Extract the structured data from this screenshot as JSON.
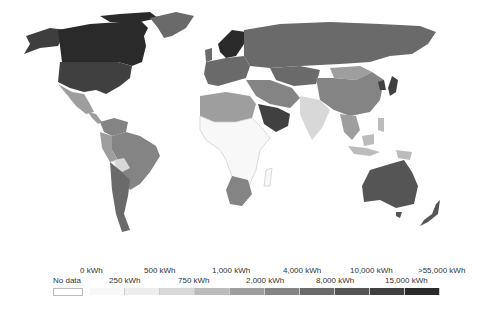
{
  "chart_data": {
    "type": "choropleth",
    "title": "",
    "legend": {
      "no_data_label": "No data",
      "unit": "kWh",
      "ticks_top": [
        "0 kWh",
        "500 kWh",
        "1,000 kWh",
        "4,000 kWh",
        "10,000 kWh",
        ">55,000 kWh"
      ],
      "ticks_bottom": [
        "250 kWh",
        "750 kWh",
        "2,000 kWh",
        "8,000 kWh",
        "15,000 kWh"
      ],
      "bins": [
        {
          "range": "0-250 kWh",
          "color": "#f8f8f8"
        },
        {
          "range": "250-500 kWh",
          "color": "#eeeeee"
        },
        {
          "range": "500-750 kWh",
          "color": "#d8d8d8"
        },
        {
          "range": "750-1,000 kWh",
          "color": "#bcbcbc"
        },
        {
          "range": "1,000-2,000 kWh",
          "color": "#9e9e9e"
        },
        {
          "range": "2,000-4,000 kWh",
          "color": "#848484"
        },
        {
          "range": "4,000-8,000 kWh",
          "color": "#6a6a6a"
        },
        {
          "range": "8,000-10,000 kWh",
          "color": "#555555"
        },
        {
          "range": "10,000-15,000 kWh",
          "color": "#404040"
        },
        {
          "range": "15,000->55,000 kWh",
          "color": "#2a2a2a"
        }
      ]
    },
    "regions": [
      {
        "name": "Canada",
        "bin": "15,000->55,000 kWh"
      },
      {
        "name": "United States",
        "bin": "10,000-15,000 kWh"
      },
      {
        "name": "Alaska",
        "bin": "10,000-15,000 kWh"
      },
      {
        "name": "Greenland",
        "bin": "4,000-8,000 kWh"
      },
      {
        "name": "Mexico",
        "bin": "1,000-2,000 kWh"
      },
      {
        "name": "Brazil",
        "bin": "2,000-4,000 kWh"
      },
      {
        "name": "Bolivia",
        "bin": "500-750 kWh"
      },
      {
        "name": "Argentina/Chile",
        "bin": "2,000-4,000 kWh"
      },
      {
        "name": "Scandinavia",
        "bin": "15,000->55,000 kWh"
      },
      {
        "name": "Europe",
        "bin": "4,000-8,000 kWh"
      },
      {
        "name": "Russia",
        "bin": "4,000-8,000 kWh"
      },
      {
        "name": "Saudi Arabia",
        "bin": "8,000-10,000 kWh"
      },
      {
        "name": "North Africa",
        "bin": "1,000-2,000 kWh"
      },
      {
        "name": "Sub-Saharan Africa",
        "bin": "0-250 kWh"
      },
      {
        "name": "South Africa",
        "bin": "4,000-8,000 kWh"
      },
      {
        "name": "India",
        "bin": "500-750 kWh"
      },
      {
        "name": "China",
        "bin": "2,000-4,000 kWh"
      },
      {
        "name": "Mongolia",
        "bin": "1,000-2,000 kWh"
      },
      {
        "name": "Australia",
        "bin": "8,000-10,000 kWh"
      },
      {
        "name": "New Zealand",
        "bin": "8,000-10,000 kWh"
      },
      {
        "name": "Indonesia",
        "bin": "750-1,000 kWh"
      }
    ]
  }
}
